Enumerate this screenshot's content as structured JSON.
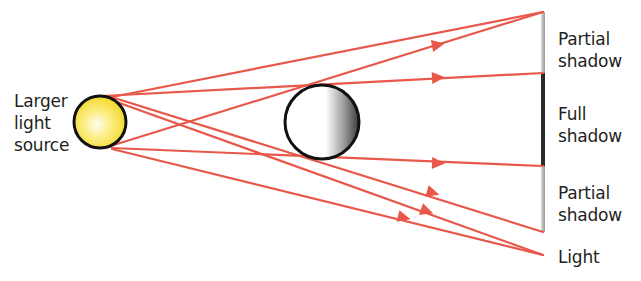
{
  "labels": {
    "source": [
      "Larger",
      "light",
      "source"
    ],
    "partial_top": [
      "Partial",
      "shadow"
    ],
    "full": [
      "Full",
      "shadow"
    ],
    "partial_bottom": [
      "Partial",
      "shadow"
    ],
    "light": [
      "Light"
    ]
  },
  "colors": {
    "ray": "#e8584a",
    "outline": "#111111",
    "sun_fill": "#f7e13a",
    "sun_center": "#fffbe0",
    "text": "#231f20",
    "screen_partial": "#b8b8b8",
    "screen_full": "#222222"
  },
  "objects": {
    "light_source": {
      "cx": 100,
      "cy": 122,
      "r": 26
    },
    "opaque_ball": {
      "cx": 322,
      "cy": 122,
      "r": 37
    },
    "screen": {
      "x": 543,
      "y_top": 12,
      "y_bottom": 232,
      "full_top": 73,
      "full_bottom": 166
    }
  },
  "rays": [
    {
      "from": [
        112,
        97
      ],
      "to": [
        543,
        12
      ],
      "arrow_at": [
        438,
        44
      ]
    },
    {
      "from": [
        100,
        96
      ],
      "to": [
        543,
        73
      ],
      "arrow_at": [
        438,
        77
      ]
    },
    {
      "from": [
        108,
        96
      ],
      "to": [
        543,
        232
      ],
      "arrow_at": [
        432,
        194
      ]
    },
    {
      "from": [
        100,
        96
      ],
      "to": [
        543,
        255
      ],
      "arrow_at": [
        427,
        212
      ]
    },
    {
      "from": [
        112,
        147
      ],
      "to": [
        543,
        166
      ],
      "arrow_at": [
        438,
        164
      ]
    },
    {
      "from": [
        112,
        148
      ],
      "to": [
        543,
        255
      ],
      "arrow_at": [
        404,
        219
      ]
    },
    {
      "from": [
        100,
        148
      ],
      "to": [
        543,
        12
      ],
      "arrow_at": null
    }
  ]
}
